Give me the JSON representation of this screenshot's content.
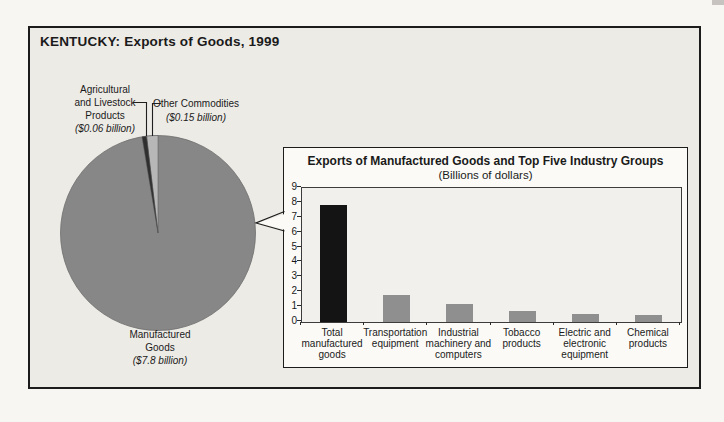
{
  "frame_title": "KENTUCKY: Exports of Goods, 1999",
  "pie": {
    "labels": {
      "agricultural": {
        "lines": [
          "Agricultural",
          "and Livestock",
          "Products"
        ],
        "value": "($0.06 billion)"
      },
      "other": {
        "name": "Other Commodities",
        "value": "($0.15 billion)"
      },
      "manufactured": {
        "lines": [
          "Manufactured",
          "Goods"
        ],
        "value": "($7.8 billion)"
      }
    }
  },
  "inset": {
    "title": "Exports of Manufactured Goods and Top Five Industry Groups",
    "subtitle": "(Billions of dollars)"
  },
  "colors": {
    "pie_manufactured": "#878787",
    "pie_other": "#b7b7b7",
    "pie_agricultural": "#2f2f2f",
    "bar_total": "#141414",
    "bar_industry": "#8f8f8f",
    "frame_border": "#1c1c1c",
    "plot_background": "#f2f0ec"
  },
  "chart_data": [
    {
      "type": "pie",
      "title": "KENTUCKY: Exports of Goods, 1999",
      "unit": "billions of dollars",
      "slices": [
        {
          "label": "Manufactured Goods",
          "value": 7.8,
          "color": "#878787"
        },
        {
          "label": "Other Commodities",
          "value": 0.15,
          "color": "#b7b7b7"
        },
        {
          "label": "Agricultural and Livestock Products",
          "value": 0.06,
          "color": "#2f2f2f"
        }
      ]
    },
    {
      "type": "bar",
      "title": "Exports of Manufactured Goods and Top Five Industry Groups",
      "subtitle": "(Billions of dollars)",
      "categories": [
        "Total manufactured goods",
        "Transportation equipment",
        "Industrial machinery and computers",
        "Tobacco products",
        "Electric and electronic equipment",
        "Chemical products"
      ],
      "category_label_lines": [
        [
          "Total",
          "manufactured",
          "goods"
        ],
        [
          "Transportation",
          "equipment"
        ],
        [
          "Industrial",
          "machinery and",
          "computers"
        ],
        [
          "Tobacco",
          "products"
        ],
        [
          "Electric and",
          "electronic",
          "equipment"
        ],
        [
          "Chemical",
          "products"
        ]
      ],
      "values": [
        7.8,
        1.8,
        1.2,
        0.7,
        0.5,
        0.45
      ],
      "bar_colors": [
        "#141414",
        "#8f8f8f",
        "#8f8f8f",
        "#8f8f8f",
        "#8f8f8f",
        "#8f8f8f"
      ],
      "ylim": [
        0,
        9
      ],
      "yticks": [
        0,
        1,
        2,
        3,
        4,
        5,
        6,
        7,
        8,
        9
      ],
      "grid": false,
      "legend": false
    }
  ]
}
